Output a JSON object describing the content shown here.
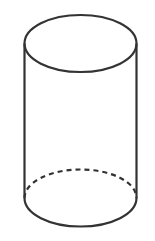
{
  "diagram": {
    "shape": "cylinder",
    "stroke_color": "#333333",
    "background_color": "#ffffff",
    "top_ellipse": {
      "cx": 80.5,
      "cy": 43.5,
      "rx": 56,
      "ry": 28.5
    },
    "bottom_ellipse": {
      "cx": 80.5,
      "cy": 198,
      "rx": 56,
      "ry": 28.5,
      "back_half_style": "dashed"
    },
    "side_lines": {
      "left_x": 24.5,
      "right_x": 136.5,
      "y_top": 43.5,
      "y_bottom": 198
    }
  }
}
